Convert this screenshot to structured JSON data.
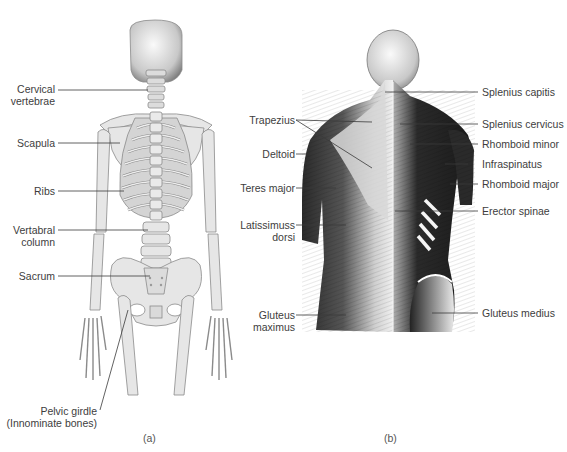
{
  "figure": {
    "panels": [
      {
        "id": "a",
        "caption": "(a)",
        "subject": "skeleton-posterior-view",
        "labels": {
          "cervical": "Cervical",
          "cervical2": "vertebrae",
          "scapula": "Scapula",
          "ribs": "Ribs",
          "vertebral": "Vertabral",
          "vertebral2": "column",
          "sacrum": "Sacrum",
          "pelvic": "Pelvic girdle",
          "pelvic2": "(Innominate bones)"
        }
      },
      {
        "id": "b",
        "caption": "(b)",
        "subject": "back-muscles-posterior-view",
        "labels": {
          "trapezius": "Trapezius",
          "deltoid": "Deltoid",
          "teres": "Teres major",
          "latissimus": "Latissimuss",
          "latissimus2": "dorsi",
          "gluteus_max": "Gluteus",
          "gluteus_max2": "maximus",
          "splenius_capitis": "Splenius capitis",
          "splenius_cervicus": "Splenius cervicus",
          "rhomboid_minor": "Rhomboid minor",
          "infraspinatus": "Infraspinatus",
          "rhomboid_major": "Rhomboid major",
          "erector": "Erector spinae",
          "gluteus_med": "Gluteus medius"
        }
      }
    ],
    "colors": {
      "bone_fill": "#e6e6e6",
      "bone_outline": "#8a8a8a",
      "rib_shadow": "#b5b5b5",
      "muscle_dark": "#1e1e1e",
      "muscle_light": "#d9d9d9",
      "leader_line": "#3a3a3a"
    }
  }
}
